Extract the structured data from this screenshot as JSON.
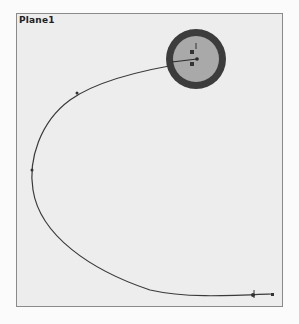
{
  "viewport": {
    "plane_label": "Plane1"
  },
  "sketch": {
    "curve_color": "#3a3a3a",
    "circle_outer_color": "#3c3c3c",
    "circle_inner_color": "#a9a9a9"
  }
}
